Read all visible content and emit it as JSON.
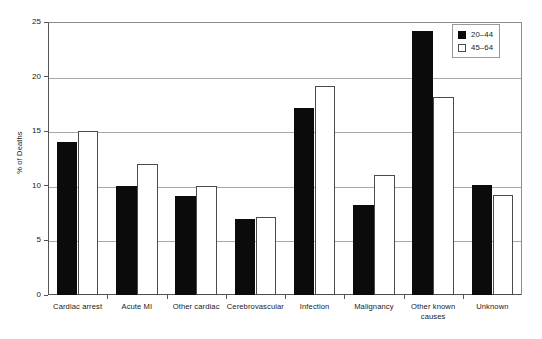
{
  "chart_data": {
    "type": "bar",
    "title": "",
    "xlabel": "",
    "ylabel": "% of Deaths",
    "ylim": [
      0,
      25
    ],
    "yticks": [
      0,
      5,
      10,
      15,
      20,
      25
    ],
    "ytick_labels": [
      "0",
      "5",
      "10",
      "15",
      "20",
      "25"
    ],
    "grid": true,
    "legend_position": "top-right",
    "categories": [
      "Cardiac arrest",
      "Acute MI",
      "Other cardiac",
      "Cerebrovascular",
      "Infection",
      "Malignancy",
      "Other known causes",
      "Unknown"
    ],
    "category_lines": [
      [
        "Cardiac arrest"
      ],
      [
        "Acute MI"
      ],
      [
        "Other cardiac"
      ],
      [
        "Cerebrovascular"
      ],
      [
        "Infection"
      ],
      [
        "Malignancy"
      ],
      [
        "Other known",
        "causes"
      ],
      [
        "Unknown"
      ]
    ],
    "series": [
      {
        "name": "20–44",
        "color": "#0b0b0b",
        "fill": "solid",
        "values": [
          14.0,
          10.0,
          9.1,
          7.0,
          17.1,
          8.2,
          24.2,
          10.1
        ]
      },
      {
        "name": "45–64",
        "color": "#ffffff",
        "fill": "open",
        "values": [
          15.0,
          12.0,
          10.0,
          7.1,
          19.1,
          11.0,
          18.1,
          9.2
        ]
      }
    ]
  },
  "legend": {
    "items": [
      {
        "label": "20–44",
        "style": "series-a"
      },
      {
        "label": "45–64",
        "style": "series-b"
      }
    ]
  },
  "axes": {
    "y_title": "% of Deaths"
  }
}
